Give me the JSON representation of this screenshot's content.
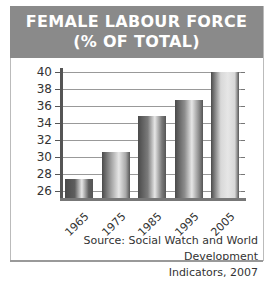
{
  "chart_data": {
    "type": "bar",
    "title": "FEMALE LABOUR FORCE",
    "subtitle": "(% OF TOTAL)",
    "categories": [
      "1965",
      "1975",
      "1985",
      "1995",
      "2005"
    ],
    "values": [
      27.4,
      30.6,
      34.8,
      36.7,
      40.0
    ],
    "xlabel": "",
    "ylabel": "",
    "ylim": [
      25,
      40
    ],
    "yticks": [
      "40",
      "38",
      "36",
      "34",
      "32",
      "30",
      "28",
      "26"
    ],
    "grid": true,
    "legend": null,
    "source_line1": "Source: Social Watch and World Development",
    "source_line2": "Indicators, 2007",
    "colors": {
      "header_bg": "#8a8a8a",
      "bars": [
        "#5e5e5e",
        "#a8a8a8",
        "#7a7a7a",
        "#8e8e8e",
        "#d8d8d8"
      ]
    }
  }
}
